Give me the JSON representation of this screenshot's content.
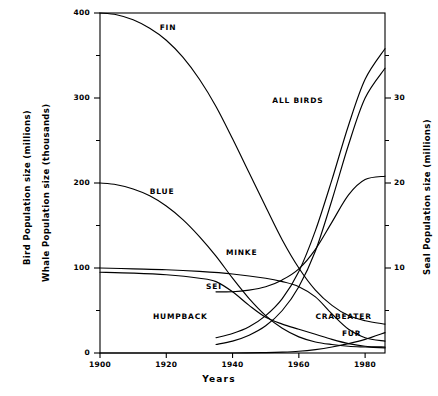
{
  "chart_data": {
    "type": "line",
    "title": "",
    "xlabel": "Years",
    "ylabel_left_1": "Bird Population size (millions)",
    "ylabel_left_2": "Whale Population size (thousands)",
    "ylabel_right": "Seal Population size (millions)",
    "xlim": [
      1900,
      1986
    ],
    "xticks": [
      1900,
      1920,
      1940,
      1960,
      1980
    ],
    "xticklabels": [
      "1900",
      "1920",
      "1940",
      "1960",
      "1980"
    ],
    "ylim_left": [
      0,
      400
    ],
    "yticks_left": [
      0,
      100,
      200,
      300,
      400
    ],
    "yticklabels_left": [
      "0",
      "100",
      "200",
      "300",
      "400"
    ],
    "yminorticks_left": [
      50,
      150,
      250,
      350
    ],
    "ylim_right": [
      0,
      40
    ],
    "yticks_right": [
      10,
      20,
      30
    ],
    "yticklabels_right": [
      "10",
      "20",
      "30"
    ],
    "yminorticks_right": [
      5,
      15,
      25,
      35
    ],
    "grid": false,
    "legend_position": "inline-annotations",
    "series": [
      {
        "name": "FIN",
        "axis": "left",
        "label": "FIN",
        "label_x": 1918,
        "label_y": 382,
        "x": [
          1900,
          1905,
          1910,
          1915,
          1920,
          1925,
          1930,
          1935,
          1940,
          1945,
          1950,
          1955,
          1960,
          1965,
          1970,
          1975,
          1980,
          1986
        ],
        "values": [
          400,
          398,
          392,
          382,
          368,
          348,
          322,
          290,
          252,
          212,
          172,
          133,
          100,
          74,
          56,
          44,
          38,
          34
        ]
      },
      {
        "name": "BLUE",
        "axis": "left",
        "label": "BLUE",
        "label_x": 1915,
        "label_y": 190,
        "x": [
          1900,
          1905,
          1910,
          1915,
          1920,
          1925,
          1930,
          1935,
          1940,
          1945,
          1950,
          1955,
          1960,
          1965,
          1970,
          1975,
          1980,
          1986
        ],
        "values": [
          200,
          198,
          193,
          185,
          173,
          157,
          137,
          114,
          88,
          64,
          44,
          29,
          19,
          13,
          10,
          8,
          7,
          6
        ]
      },
      {
        "name": "SEI",
        "axis": "left",
        "label": "SEI",
        "label_x": 1932,
        "label_y": 78,
        "x": [
          1900,
          1910,
          1920,
          1930,
          1940,
          1950,
          1955,
          1960,
          1965,
          1970,
          1975,
          1980,
          1986
        ],
        "values": [
          100,
          99,
          98,
          96,
          93,
          88,
          84,
          78,
          66,
          46,
          28,
          18,
          14
        ]
      },
      {
        "name": "HUMPBACK",
        "axis": "left",
        "label": "HUMPBACK",
        "label_x": 1916,
        "label_y": 42,
        "x": [
          1900,
          1910,
          1920,
          1930,
          1935,
          1940,
          1945,
          1950,
          1955,
          1960,
          1965,
          1970,
          1975,
          1980,
          1986
        ],
        "values": [
          95,
          94,
          92,
          88,
          84,
          72,
          56,
          42,
          34,
          28,
          22,
          16,
          11,
          8,
          7
        ]
      },
      {
        "name": "MINKE",
        "axis": "left",
        "label": "MINKE",
        "label_x": 1938,
        "label_y": 118,
        "x": [
          1935,
          1940,
          1945,
          1950,
          1955,
          1960,
          1965,
          1970,
          1975,
          1980,
          1986
        ],
        "values": [
          72,
          72,
          74,
          78,
          86,
          99,
          122,
          154,
          186,
          204,
          208
        ]
      },
      {
        "name": "ALL BIRDS",
        "axis": "left",
        "label": "ALL BIRDS",
        "label_x": 1952,
        "label_y": 297,
        "x": [
          1935,
          1940,
          1945,
          1950,
          1955,
          1960,
          1965,
          1970,
          1975,
          1980,
          1986
        ],
        "values": [
          18,
          23,
          31,
          44,
          64,
          96,
          144,
          204,
          268,
          322,
          358
        ]
      },
      {
        "name": "CRABEATER",
        "axis": "right",
        "label": "CRABEATER",
        "label_x": 1965,
        "label_y": 4.2,
        "x": [
          1935,
          1940,
          1945,
          1950,
          1955,
          1960,
          1965,
          1970,
          1975,
          1980,
          1986
        ],
        "values": [
          1.0,
          1.4,
          2.1,
          3.2,
          5.0,
          7.8,
          12.0,
          18.0,
          24.5,
          30.0,
          33.5
        ]
      },
      {
        "name": "FUR",
        "axis": "right",
        "label": "FUR",
        "label_x": 1973,
        "label_y": 2.2,
        "x": [
          1900,
          1920,
          1940,
          1950,
          1955,
          1960,
          1965,
          1970,
          1975,
          1980,
          1986
        ],
        "values": [
          0.0,
          0.0,
          0.0,
          0.05,
          0.1,
          0.2,
          0.4,
          0.7,
          1.1,
          1.6,
          2.4
        ]
      }
    ]
  },
  "axes": {
    "left_title_1": "Bird Population size (millions)",
    "left_title_2": "Whale Population size (thousands)",
    "right_title": "Seal Population size (millions)",
    "x_title": "Years"
  },
  "style": {
    "line_color": "#000000",
    "axis_color": "#000000",
    "background": "#ffffff"
  }
}
